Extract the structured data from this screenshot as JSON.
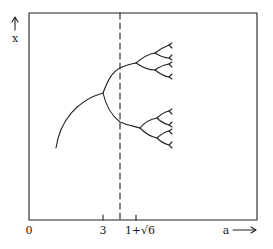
{
  "diagram": {
    "type": "bifurcation-diagram",
    "y_axis": {
      "label": "x",
      "arrow": "up"
    },
    "x_axis": {
      "label": "a",
      "arrow": "right",
      "ticks": [
        {
          "label": "0",
          "x": 29
        },
        {
          "label": "3",
          "x": 103
        },
        {
          "label": "1+√6",
          "x": 136
        }
      ]
    },
    "dashed_line": {
      "x": 120
    },
    "colors": {
      "ink": "#222222",
      "background": "#ffffff"
    }
  }
}
